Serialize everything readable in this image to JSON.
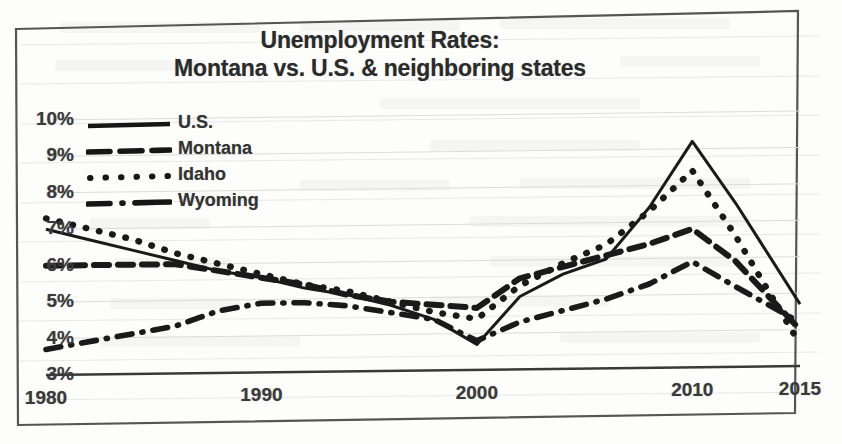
{
  "figure": {
    "border_color": "#4a4a4a",
    "background": "#fdfdfc"
  },
  "chart_data": {
    "type": "line",
    "title": "Unemployment Rates: Montana vs. U.S. & neighboring states",
    "title_line1": "Unemployment Rates:",
    "title_line2": "Montana vs. U.S. & neighboring states",
    "xlabel": "",
    "ylabel": "",
    "grid": true,
    "grid_axis": "y",
    "legend_position": "upper-left",
    "xlim": [
      1980,
      2015
    ],
    "ylim": [
      3,
      10
    ],
    "x_tick_labels": [
      "1980",
      "1990",
      "2000",
      "2010",
      "2015"
    ],
    "x_ticks": [
      1980,
      1990,
      2000,
      2010,
      2015
    ],
    "y_tick_labels": [
      "10%",
      "9%",
      "8%",
      "7%",
      "6%",
      "5%",
      "4%",
      "3%"
    ],
    "y_ticks": [
      10,
      9,
      8,
      7,
      6,
      5,
      4,
      3
    ],
    "series": [
      {
        "name": "U.S.",
        "style": "solid",
        "color": "#1a1a1a",
        "x": [
          1980,
          1982,
          1984,
          1986,
          1988,
          1990,
          1992,
          1994,
          1996,
          1998,
          2000,
          2002,
          2004,
          2006,
          2008,
          2010,
          2012,
          2015
        ],
        "values": [
          7.0,
          6.7,
          6.4,
          6.1,
          5.8,
          5.6,
          5.3,
          5.1,
          4.8,
          4.4,
          3.7,
          5.0,
          5.6,
          6.0,
          7.4,
          9.2,
          7.5,
          4.7
        ]
      },
      {
        "name": "Montana",
        "style": "dashed",
        "color": "#1a1a1a",
        "x": [
          1980,
          1983,
          1986,
          1988,
          1990,
          1992,
          1994,
          1996,
          1998,
          2000,
          2002,
          2004,
          2006,
          2008,
          2010,
          2012,
          2015
        ],
        "values": [
          6.0,
          6.0,
          6.0,
          5.8,
          5.6,
          5.4,
          5.1,
          4.9,
          4.8,
          4.7,
          5.5,
          5.8,
          6.1,
          6.4,
          6.8,
          5.9,
          4.0
        ]
      },
      {
        "name": "Idaho",
        "style": "dotted",
        "color": "#1a1a1a",
        "x": [
          1980,
          1982,
          1984,
          1986,
          1988,
          1990,
          1992,
          1994,
          1996,
          1998,
          2000,
          2002,
          2004,
          2006,
          2008,
          2010,
          2012,
          2015
        ],
        "values": [
          7.3,
          7.0,
          6.7,
          6.3,
          6.0,
          5.7,
          5.4,
          5.2,
          4.9,
          4.6,
          4.4,
          5.3,
          5.9,
          6.4,
          7.3,
          8.4,
          6.6,
          3.6
        ]
      },
      {
        "name": "Wyoming",
        "style": "dashdot",
        "color": "#1a1a1a",
        "x": [
          1980,
          1983,
          1986,
          1988,
          1990,
          1992,
          1994,
          1996,
          1998,
          2000,
          2002,
          2004,
          2006,
          2008,
          2010,
          2012,
          2015
        ],
        "values": [
          3.7,
          4.0,
          4.3,
          4.7,
          4.9,
          4.9,
          4.8,
          4.6,
          4.4,
          3.8,
          4.3,
          4.6,
          4.9,
          5.3,
          5.9,
          5.2,
          4.2
        ]
      }
    ]
  },
  "legend": {
    "items": [
      {
        "label": "U.S.",
        "style": "solid"
      },
      {
        "label": "Montana",
        "style": "dashed"
      },
      {
        "label": "Idaho",
        "style": "dotted"
      },
      {
        "label": "Wyoming",
        "style": "dashdot"
      }
    ]
  }
}
